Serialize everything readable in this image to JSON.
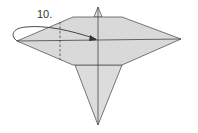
{
  "diagram": {
    "step_label": "10.",
    "colors": {
      "paper_fill": "#d9d9d9",
      "line": "#444444",
      "background": "#ffffff"
    },
    "instruction_arrow": "fold left point over to center crease",
    "fold_line": "valley fold (dashed)"
  }
}
